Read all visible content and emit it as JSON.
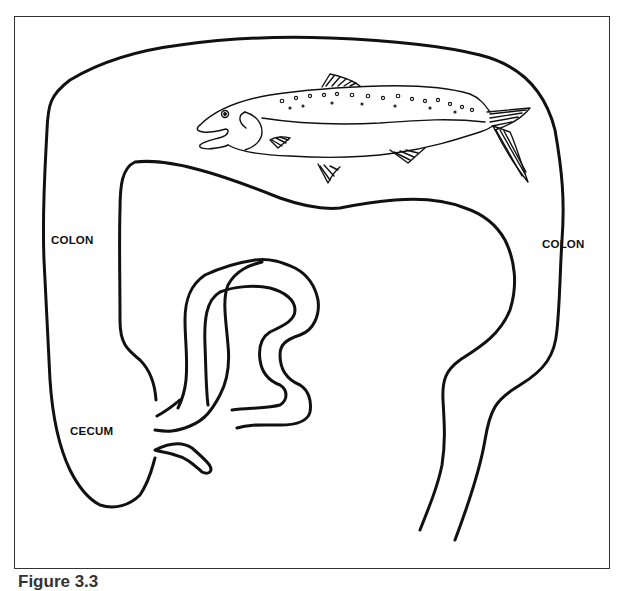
{
  "figure": {
    "caption": "Figure 3.3",
    "labels": {
      "colon_left": "COLON",
      "colon_right": "COLON",
      "cecum": "CECUM"
    },
    "illustration": "fish-inside-colon",
    "stroke_color": "#111111",
    "background": "#ffffff"
  }
}
